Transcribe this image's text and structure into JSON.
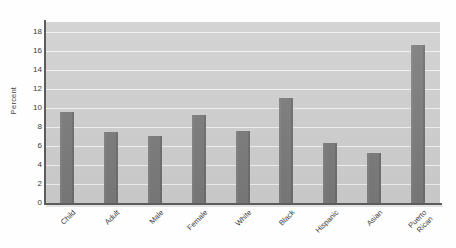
{
  "chart_data": {
    "type": "bar",
    "title": "",
    "subtitle": "",
    "xlabel": "",
    "ylabel": "Percent",
    "categories": [
      "Child",
      "Adult",
      "Male",
      "Female",
      "White",
      "Black",
      "Hispanic",
      "Asian",
      "Puerto Rican"
    ],
    "values": [
      9.6,
      7.5,
      7.0,
      9.25,
      7.6,
      11.0,
      6.35,
      5.25,
      16.6
    ],
    "ylim": [
      0,
      19
    ],
    "yticks": [
      0,
      2,
      4,
      6,
      8,
      10,
      12,
      14,
      16,
      18
    ],
    "ytick_labels": [
      "0",
      "2",
      "4",
      "6",
      "8",
      "10",
      "12",
      "14",
      "16",
      "18"
    ],
    "grid": true,
    "grid_axis": "y",
    "legend": false,
    "legend_position": "none",
    "annotations": [],
    "colors": {
      "bar": "#7a7a7a",
      "plot_background": "#cfcfcf",
      "gridline": "#f2f2f2",
      "axis": "#5c5c5c",
      "text": "#3a3a3a",
      "figure_background": "#fefefe"
    },
    "category_label_rotation": -45,
    "multiline_labels": {
      "Puerto Rican": [
        "Puerto",
        "Rican"
      ]
    }
  }
}
